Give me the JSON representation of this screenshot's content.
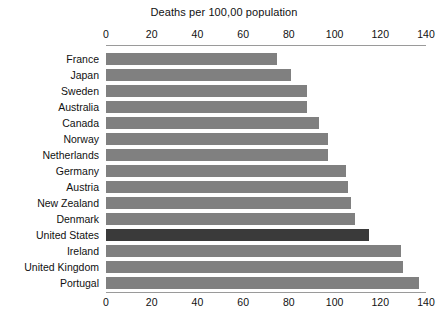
{
  "chart_data": {
    "type": "bar",
    "orientation": "horizontal",
    "title": "Deaths per 100,00 population",
    "xlabel": "",
    "ylabel": "",
    "xlim": [
      0,
      140
    ],
    "xticks": [
      0,
      20,
      40,
      60,
      80,
      100,
      120,
      140
    ],
    "xtick_labels": [
      "0",
      "20",
      "40",
      "60",
      "80",
      "100",
      "120",
      "140"
    ],
    "grid": false,
    "legend": null,
    "axis_positions": [
      "top",
      "bottom"
    ],
    "categories": [
      "France",
      "Japan",
      "Sweden",
      "Australia",
      "Canada",
      "Norway",
      "Netherlands",
      "Germany",
      "Austria",
      "New Zealand",
      "Denmark",
      "United States",
      "Ireland",
      "United Kingdom",
      "Portugal"
    ],
    "values": [
      75,
      81,
      88,
      88,
      93,
      97,
      97,
      105,
      106,
      107,
      109,
      115,
      129,
      130,
      137
    ],
    "highlight_category": "United States",
    "colors": {
      "bar": "#808080",
      "bar_highlight": "#3a3a3a",
      "axis": "#9a9a9a",
      "text": "#111111",
      "background": "#ffffff"
    }
  }
}
